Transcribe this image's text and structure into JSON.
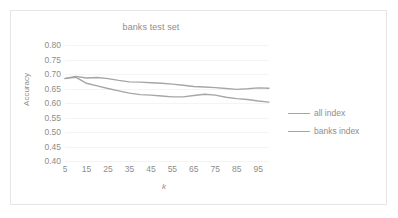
{
  "figure": {
    "border_color": "#e6e6e6",
    "background": "#ffffff"
  },
  "legend": {
    "position": "right",
    "entries": [
      {
        "label": "all index",
        "color": "#a6a6a6"
      },
      {
        "label": "banks index",
        "color": "#a6a6a6"
      }
    ]
  },
  "chart_data": {
    "type": "line",
    "title": "banks test set",
    "xlabel": "k",
    "ylabel": "Accuracy",
    "xlim": [
      5,
      100
    ],
    "ylim": [
      0.4,
      0.8
    ],
    "ytick_labels": [
      "0.80",
      "0.75",
      "0.70",
      "0.65",
      "0.60",
      "0.55",
      "0.50",
      "0.45",
      "0.40"
    ],
    "ytick_values": [
      0.8,
      0.75,
      0.7,
      0.65,
      0.6,
      0.55,
      0.5,
      0.45,
      0.4
    ],
    "xtick_labels": [
      "5",
      "15",
      "25",
      "35",
      "45",
      "55",
      "65",
      "75",
      "85",
      "95"
    ],
    "xtick_values": [
      5,
      15,
      25,
      35,
      45,
      55,
      65,
      75,
      85,
      95
    ],
    "grid": true,
    "legend_position": "right",
    "x": [
      5,
      10,
      15,
      20,
      25,
      30,
      35,
      40,
      45,
      50,
      55,
      60,
      65,
      70,
      75,
      80,
      85,
      90,
      95,
      100
    ],
    "series": [
      {
        "name": "all index",
        "color": "#a6a6a6",
        "values": [
          0.685,
          0.692,
          0.686,
          0.688,
          0.684,
          0.678,
          0.673,
          0.672,
          0.67,
          0.668,
          0.665,
          0.661,
          0.657,
          0.655,
          0.653,
          0.65,
          0.647,
          0.649,
          0.652,
          0.651
        ]
      },
      {
        "name": "banks index",
        "color": "#a6a6a6",
        "values": [
          0.684,
          0.689,
          0.668,
          0.659,
          0.65,
          0.642,
          0.634,
          0.629,
          0.627,
          0.624,
          0.621,
          0.621,
          0.626,
          0.63,
          0.627,
          0.62,
          0.615,
          0.612,
          0.607,
          0.603
        ]
      }
    ]
  }
}
